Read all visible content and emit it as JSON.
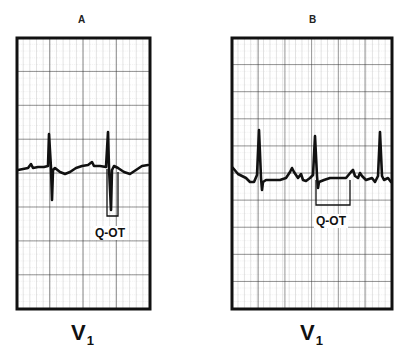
{
  "figure": {
    "panels": [
      {
        "id": "A",
        "letter": "A",
        "lead": "V",
        "lead_subscript": "1",
        "annotation": "Q-OT",
        "frame": {
          "x": 17,
          "y": 38,
          "w": 133,
          "h": 271
        },
        "baseline_y": 168,
        "qot_bracket": {
          "x1": 106,
          "x2": 117,
          "top_y": 168,
          "bottom_y": 216
        }
      },
      {
        "id": "B",
        "letter": "B",
        "lead": "V",
        "lead_subscript": "1",
        "annotation": "Q-OT",
        "frame": {
          "x": 232,
          "y": 38,
          "w": 160,
          "h": 271
        },
        "baseline_y": 178,
        "qot_bracket": {
          "x1": 315,
          "x2": 350,
          "top_y": 178,
          "bottom_y": 205
        }
      }
    ],
    "colors": {
      "background": "#ffffff",
      "frame": "#111111",
      "major_grid": "#333333",
      "minor_grid": "#9a9a9a",
      "trace": "#111111"
    }
  }
}
